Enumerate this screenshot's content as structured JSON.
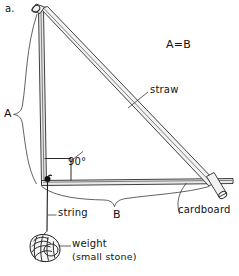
{
  "figure": {
    "panel_label": "a.",
    "relation_label": "A=B",
    "labels": {
      "straw": "straw",
      "cardboard": "cardboard",
      "string": "string",
      "weight_line1": "weight",
      "weight_line2": "(small stone)",
      "right_angle": "90°",
      "side_a": "A",
      "side_b": "B"
    },
    "colors": {
      "ink": "#1a1a1a",
      "line": "#2b2b2b",
      "background": "#ffffff",
      "board_fill": "#e9e9e9",
      "straw_fill": "#f2f2f2"
    },
    "icons": {
      "pin": "pin-icon",
      "stone": "stone-icon"
    }
  }
}
